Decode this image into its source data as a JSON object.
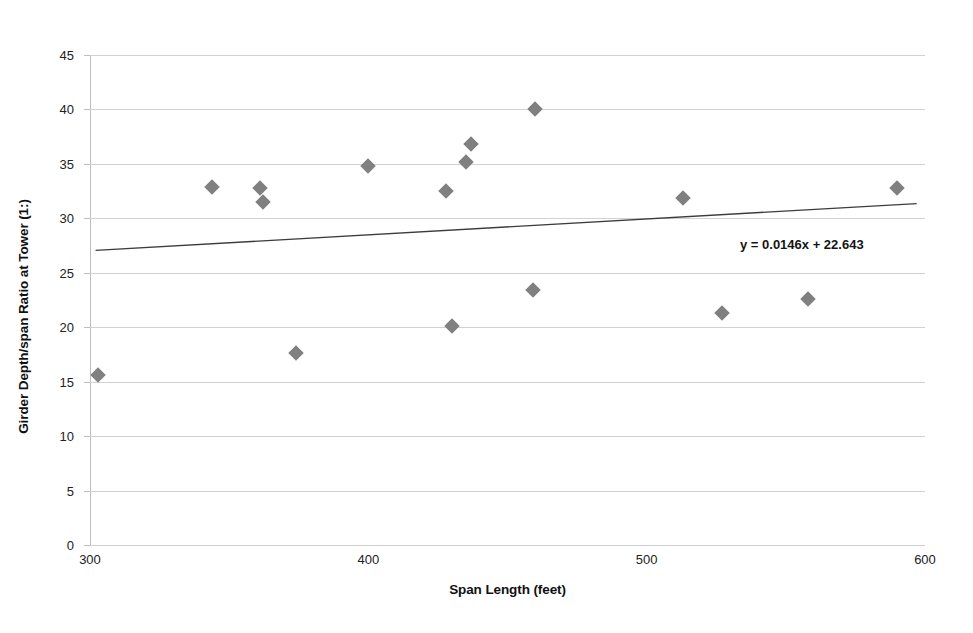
{
  "chart_data": {
    "type": "scatter",
    "title": "",
    "xlabel": "Span Length (feet)",
    "ylabel": "Girder Depth/span Ratio at Tower (1:)",
    "xlim": [
      300,
      600
    ],
    "ylim": [
      0,
      45
    ],
    "xticks": [
      300,
      400,
      500,
      600
    ],
    "yticks": [
      0,
      5,
      10,
      15,
      20,
      25,
      30,
      35,
      40,
      45
    ],
    "grid": true,
    "legend": "none",
    "marker_shape": "diamond",
    "marker_color": "#808080",
    "series": [
      {
        "name": "Girder depth/span ratio at tower",
        "points": [
          {
            "x": 303,
            "y": 15.6
          },
          {
            "x": 344,
            "y": 32.9
          },
          {
            "x": 361,
            "y": 32.8
          },
          {
            "x": 362,
            "y": 31.5
          },
          {
            "x": 374,
            "y": 17.6
          },
          {
            "x": 400,
            "y": 34.8
          },
          {
            "x": 428,
            "y": 32.5
          },
          {
            "x": 430,
            "y": 20.1
          },
          {
            "x": 435,
            "y": 35.2
          },
          {
            "x": 437,
            "y": 36.8
          },
          {
            "x": 459,
            "y": 23.4
          },
          {
            "x": 460,
            "y": 40.0
          },
          {
            "x": 513,
            "y": 31.9
          },
          {
            "x": 527,
            "y": 21.3
          },
          {
            "x": 558,
            "y": 22.6
          },
          {
            "x": 590,
            "y": 32.8
          }
        ]
      }
    ],
    "trendline": {
      "equation": "y = 0.0146x + 22.643",
      "slope": 0.0146,
      "intercept": 22.643,
      "x_start": 302,
      "x_end": 597,
      "color": "#3c3c3c"
    },
    "annotations": [
      {
        "name": "trendline-equation",
        "text": "y = 0.0146x + 22.643"
      }
    ]
  }
}
